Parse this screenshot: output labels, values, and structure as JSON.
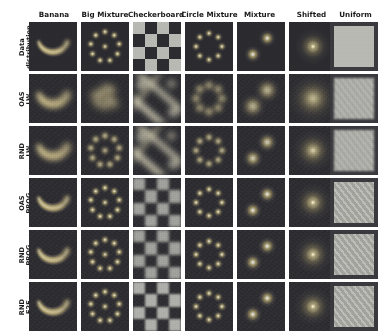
{
  "figure": {
    "kind": "grid-of-density-heatmaps",
    "background": "#ffffff",
    "n_rows": 6,
    "n_cols": 7,
    "panel_bg": "#2a2a2f",
    "highlight_color": "#e8e8e2"
  },
  "columns": [
    {
      "id": "banana",
      "label": "Banana"
    },
    {
      "id": "big_mixture",
      "label": "Big Mixture"
    },
    {
      "id": "checkerboard",
      "label": "Checkerboard"
    },
    {
      "id": "circle_mixture",
      "label": "Circle Mixture"
    },
    {
      "id": "mixture",
      "label": "Mixture"
    },
    {
      "id": "shifted",
      "label": "Shifted"
    },
    {
      "id": "uniform",
      "label": "Uniform"
    }
  ],
  "rows": [
    {
      "id": "data_distribution",
      "label": "Data\ndistribution"
    },
    {
      "id": "oas_lw",
      "label": "OAS\nLW"
    },
    {
      "id": "rnd_lw",
      "label": "RND\nLW"
    },
    {
      "id": "oas_prog",
      "label": "OAS\nPROG"
    },
    {
      "id": "rnd_prog",
      "label": "RND\nPROG"
    },
    {
      "id": "rnd_e2e",
      "label": "RND\nE2E"
    }
  ],
  "chart_data": {
    "type": "heatmap",
    "title": "",
    "xlabel": "",
    "ylabel": "",
    "grid": false,
    "legend": "none",
    "row_labels": [
      "Data distribution",
      "OAS LW",
      "RND LW",
      "OAS PROG",
      "RND PROG",
      "RND E2E"
    ],
    "col_labels": [
      "Banana",
      "Big Mixture",
      "Checkerboard",
      "Circle Mixture",
      "Mixture",
      "Shifted",
      "Uniform"
    ],
    "cells": [
      {
        "row": "Data distribution",
        "col": "Banana",
        "pattern": "crescent",
        "quality": "reference",
        "modes": 1
      },
      {
        "row": "Data distribution",
        "col": "Big Mixture",
        "pattern": "ring",
        "quality": "reference",
        "modes": 9
      },
      {
        "row": "Data distribution",
        "col": "Checkerboard",
        "pattern": "checker",
        "quality": "reference",
        "modes": 8
      },
      {
        "row": "Data distribution",
        "col": "Circle Mixture",
        "pattern": "ring",
        "quality": "reference",
        "modes": 8
      },
      {
        "row": "Data distribution",
        "col": "Mixture",
        "pattern": "two-blob",
        "quality": "reference",
        "modes": 2
      },
      {
        "row": "Data distribution",
        "col": "Shifted",
        "pattern": "one-blob",
        "quality": "reference",
        "modes": 1
      },
      {
        "row": "Data distribution",
        "col": "Uniform",
        "pattern": "uniform",
        "quality": "reference",
        "modes": 0
      },
      {
        "row": "OAS LW",
        "col": "Banana",
        "pattern": "crescent",
        "quality": "blurred",
        "modes": 1
      },
      {
        "row": "OAS LW",
        "col": "Big Mixture",
        "pattern": "diffuse",
        "quality": "poor",
        "modes": 0
      },
      {
        "row": "OAS LW",
        "col": "Checkerboard",
        "pattern": "streaks",
        "quality": "poor",
        "modes": 0
      },
      {
        "row": "OAS LW",
        "col": "Circle Mixture",
        "pattern": "ring",
        "quality": "blurred",
        "modes": 8
      },
      {
        "row": "OAS LW",
        "col": "Mixture",
        "pattern": "two-blob",
        "quality": "blurred",
        "modes": 2
      },
      {
        "row": "OAS LW",
        "col": "Shifted",
        "pattern": "one-blob",
        "quality": "blurred",
        "modes": 1
      },
      {
        "row": "OAS LW",
        "col": "Uniform",
        "pattern": "uniform",
        "quality": "blurred",
        "modes": 0
      },
      {
        "row": "RND LW",
        "col": "Banana",
        "pattern": "crescent",
        "quality": "blurred",
        "modes": 1
      },
      {
        "row": "RND LW",
        "col": "Big Mixture",
        "pattern": "ring",
        "quality": "fair",
        "modes": 9
      },
      {
        "row": "RND LW",
        "col": "Checkerboard",
        "pattern": "streaks",
        "quality": "poor",
        "modes": 0
      },
      {
        "row": "RND LW",
        "col": "Circle Mixture",
        "pattern": "ring",
        "quality": "fair",
        "modes": 8
      },
      {
        "row": "RND LW",
        "col": "Mixture",
        "pattern": "two-blob",
        "quality": "fair",
        "modes": 2
      },
      {
        "row": "RND LW",
        "col": "Shifted",
        "pattern": "one-blob",
        "quality": "fair",
        "modes": 1
      },
      {
        "row": "RND LW",
        "col": "Uniform",
        "pattern": "uniform",
        "quality": "blurred",
        "modes": 0
      },
      {
        "row": "OAS PROG",
        "col": "Banana",
        "pattern": "crescent",
        "quality": "good",
        "modes": 1
      },
      {
        "row": "OAS PROG",
        "col": "Big Mixture",
        "pattern": "ring",
        "quality": "good",
        "modes": 9
      },
      {
        "row": "OAS PROG",
        "col": "Checkerboard",
        "pattern": "checker",
        "quality": "fair",
        "modes": 8
      },
      {
        "row": "OAS PROG",
        "col": "Circle Mixture",
        "pattern": "ring",
        "quality": "good",
        "modes": 8
      },
      {
        "row": "OAS PROG",
        "col": "Mixture",
        "pattern": "two-blob",
        "quality": "good",
        "modes": 2
      },
      {
        "row": "OAS PROG",
        "col": "Shifted",
        "pattern": "one-blob",
        "quality": "good",
        "modes": 1
      },
      {
        "row": "OAS PROG",
        "col": "Uniform",
        "pattern": "uniform",
        "quality": "good",
        "modes": 0
      },
      {
        "row": "RND PROG",
        "col": "Banana",
        "pattern": "crescent",
        "quality": "good",
        "modes": 1
      },
      {
        "row": "RND PROG",
        "col": "Big Mixture",
        "pattern": "ring",
        "quality": "good",
        "modes": 9
      },
      {
        "row": "RND PROG",
        "col": "Checkerboard",
        "pattern": "checker",
        "quality": "fair",
        "modes": 8
      },
      {
        "row": "RND PROG",
        "col": "Circle Mixture",
        "pattern": "ring",
        "quality": "good",
        "modes": 8
      },
      {
        "row": "RND PROG",
        "col": "Mixture",
        "pattern": "two-blob",
        "quality": "good",
        "modes": 2
      },
      {
        "row": "RND PROG",
        "col": "Shifted",
        "pattern": "one-blob",
        "quality": "good",
        "modes": 1
      },
      {
        "row": "RND PROG",
        "col": "Uniform",
        "pattern": "uniform",
        "quality": "good",
        "modes": 0
      },
      {
        "row": "RND E2E",
        "col": "Banana",
        "pattern": "crescent",
        "quality": "good",
        "modes": 1
      },
      {
        "row": "RND E2E",
        "col": "Big Mixture",
        "pattern": "ring",
        "quality": "good",
        "modes": 9
      },
      {
        "row": "RND E2E",
        "col": "Checkerboard",
        "pattern": "checker",
        "quality": "good",
        "modes": 8
      },
      {
        "row": "RND E2E",
        "col": "Circle Mixture",
        "pattern": "ring",
        "quality": "good",
        "modes": 8
      },
      {
        "row": "RND E2E",
        "col": "Mixture",
        "pattern": "two-blob",
        "quality": "good",
        "modes": 2
      },
      {
        "row": "RND E2E",
        "col": "Shifted",
        "pattern": "one-blob",
        "quality": "good",
        "modes": 1
      },
      {
        "row": "RND E2E",
        "col": "Uniform",
        "pattern": "uniform",
        "quality": "good",
        "modes": 0
      }
    ]
  }
}
